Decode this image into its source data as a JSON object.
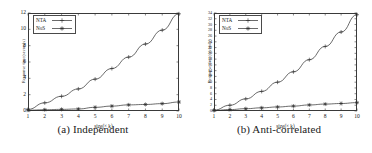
{
  "figure": {
    "panels": [
      {
        "id": "independent",
        "caption": "(a) Independent",
        "xlabel": "size(× k)",
        "ylabel": "Response time(seconds)",
        "legend": [
          {
            "label": "NTA",
            "marker": "plus"
          },
          {
            "label": "NoS",
            "marker": "star"
          }
        ],
        "xticks": [
          "1",
          "2",
          "3",
          "4",
          "5",
          "6",
          "7",
          "8",
          "9",
          "10"
        ],
        "yticks": [
          "0",
          "2",
          "4",
          "6",
          "8",
          "10",
          "12"
        ],
        "chart_data": {
          "type": "line",
          "title": "(a) Independent",
          "xlabel": "size(× k)",
          "ylabel": "Response time(seconds)",
          "xlim": [
            1,
            10
          ],
          "ylim": [
            0,
            12
          ],
          "grid": false,
          "legend_position": "top-left",
          "x": [
            1,
            2,
            3,
            4,
            5,
            6,
            7,
            8,
            9,
            10
          ],
          "series": [
            {
              "name": "NTA",
              "marker": "plus",
              "values": [
                0.2,
                1.0,
                1.8,
                2.7,
                3.9,
                5.2,
                6.6,
                8.2,
                9.9,
                11.9
              ]
            },
            {
              "name": "NoS",
              "marker": "star",
              "values": [
                0.1,
                0.15,
                0.2,
                0.25,
                0.45,
                0.6,
                0.75,
                0.8,
                0.9,
                1.1
              ]
            }
          ]
        }
      },
      {
        "id": "anti-correlated",
        "caption": "(b) Anti-correlated",
        "xlabel": "size(× k)",
        "ylabel": "Response time(seconds)",
        "legend": [
          {
            "label": "NTA",
            "marker": "plus"
          },
          {
            "label": "NoS",
            "marker": "star"
          }
        ],
        "xticks": [
          "1",
          "2",
          "3",
          "4",
          "5",
          "6",
          "7",
          "8",
          "9",
          "10"
        ],
        "yticks": [
          "0",
          "2",
          "4",
          "6",
          "8",
          "10",
          "12",
          "14",
          "16",
          "18",
          "20",
          "22",
          "24",
          "26",
          "28",
          "30",
          "32",
          "34"
        ],
        "chart_data": {
          "type": "line",
          "title": "(b) Anti-correlated",
          "xlabel": "size(× k)",
          "ylabel": "Response time(seconds)",
          "xlim": [
            1,
            10
          ],
          "ylim": [
            0,
            34
          ],
          "grid": false,
          "legend_position": "top-left",
          "x": [
            1,
            2,
            3,
            4,
            5,
            6,
            7,
            8,
            9,
            10
          ],
          "series": [
            {
              "name": "NTA",
              "marker": "plus",
              "values": [
                0.3,
                2.0,
                4.2,
                6.8,
                10.0,
                13.6,
                17.8,
                22.4,
                27.4,
                33.4
              ]
            },
            {
              "name": "NoS",
              "marker": "star",
              "values": [
                0.2,
                0.5,
                0.8,
                1.1,
                1.4,
                1.7,
                2.1,
                2.4,
                2.6,
                2.9
              ]
            }
          ]
        }
      }
    ]
  }
}
